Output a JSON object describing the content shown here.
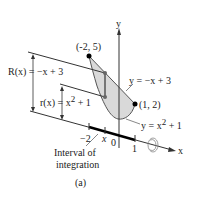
{
  "diagram": {
    "caption": "(a)",
    "axes": {
      "x_label": "x",
      "y_label": "y"
    },
    "points": [
      {
        "label": "(-2, 5)"
      },
      {
        "label": "(1, 2)"
      }
    ],
    "curves": {
      "upper": "y = −x + 3",
      "lower": "y = x",
      "lower_exp": "2",
      "lower_tail": " + 1"
    },
    "radii": {
      "outer": "R(x) = −x + 3",
      "inner_pre": "r(x) = x",
      "inner_exp": "2",
      "inner_tail": " + 1"
    },
    "ticks": {
      "neg2": "−2",
      "x": "x",
      "zero": "0",
      "one": "1"
    },
    "interval": {
      "line1": "Interval of",
      "line2": "integration"
    },
    "colors": {
      "region_fill": "#d9d9d9",
      "line": "#333333",
      "point": "#000000"
    }
  }
}
